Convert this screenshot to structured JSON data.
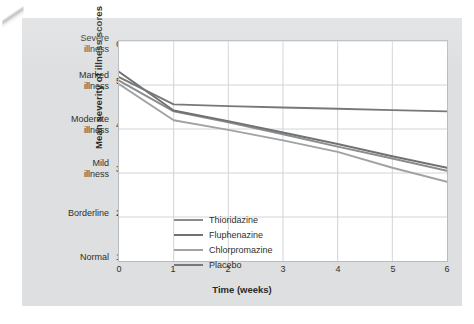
{
  "chart_data": {
    "type": "line",
    "title": "",
    "xlabel": "Time (weeks)",
    "ylabel": "Mean severity of illness scores",
    "x": [
      0,
      1,
      2,
      3,
      4,
      5,
      6
    ],
    "xlim": [
      0,
      6
    ],
    "ylim": [
      1.0,
      6.0
    ],
    "grid": true,
    "legend_position": "inside-lower-left",
    "x_ticks": [
      "0",
      "1",
      "2",
      "3",
      "4",
      "5",
      "6"
    ],
    "y_ticks": [
      {
        "value": "6.00",
        "category": "Severe illness",
        "line1": "Severe",
        "line2": "illness"
      },
      {
        "value": "5.00",
        "category": "Marked illness",
        "line1": "Marked",
        "line2": "illness"
      },
      {
        "value": "4.00",
        "category": "Moderate illness",
        "line1": "Moderate",
        "line2": "illness"
      },
      {
        "value": "3.00",
        "category": "Mild illness",
        "line1": "Mild",
        "line2": "illness"
      },
      {
        "value": "2.00",
        "category": "Borderline",
        "line1": "Borderline",
        "line2": ""
      },
      {
        "value": "1.00",
        "category": "Normal",
        "line1": "Normal",
        "line2": ""
      }
    ],
    "series": [
      {
        "name": "Thioridazine",
        "color": "#8a8c8e",
        "values": [
          5.1,
          4.4,
          4.15,
          3.88,
          3.6,
          3.33,
          3.05
        ]
      },
      {
        "name": "Fluphenazine",
        "color": "#6f7173",
        "values": [
          5.3,
          4.42,
          4.18,
          3.92,
          3.66,
          3.38,
          3.12
        ]
      },
      {
        "name": "Chlorpromazine",
        "color": "#a0a2a4",
        "values": [
          5.02,
          4.2,
          3.98,
          3.74,
          3.48,
          3.12,
          2.8
        ]
      },
      {
        "name": "Placebo",
        "color": "#76787a",
        "values": [
          5.18,
          4.56,
          4.52,
          4.49,
          4.46,
          4.43,
          4.4
        ]
      }
    ]
  },
  "legend": {
    "items": [
      {
        "label": "Thioridazine",
        "color": "#8a8c8e"
      },
      {
        "label": "Fluphenazine",
        "color": "#6f7173"
      },
      {
        "label": "Chlorpromazine",
        "color": "#a0a2a4"
      },
      {
        "label": "Placebo",
        "color": "#76787a"
      }
    ]
  },
  "colors": {
    "figure_background": "#dedfe0",
    "plot_background": "#ffffff",
    "grid": "#d2d4d6",
    "axis": "#b9bcbe",
    "text": "#2f2f2f"
  }
}
